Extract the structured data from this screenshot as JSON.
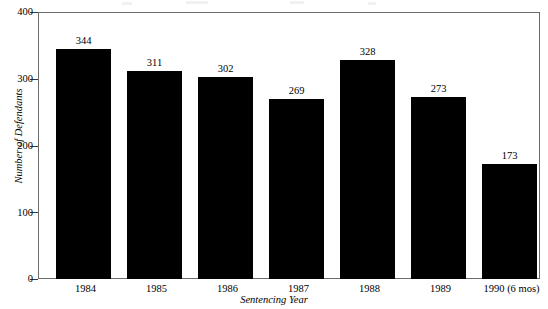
{
  "chart_data": {
    "type": "bar",
    "title": "",
    "xlabel": "Sentencing Year",
    "ylabel": "Number of Defendants",
    "categories": [
      "1984",
      "1985",
      "1986",
      "1987",
      "1988",
      "1989",
      "1990 (6 mos)"
    ],
    "values": [
      344,
      311,
      302,
      269,
      328,
      273,
      173
    ],
    "ylim": [
      0,
      400
    ],
    "yticks": [
      0,
      100,
      200,
      300,
      400
    ],
    "ytick_labels": [
      "0",
      "100",
      "200",
      "300",
      "400"
    ],
    "grid": false,
    "legend": null,
    "bar_color": "#000000",
    "frame_color": "#6b6b6b",
    "background": "#ffffff",
    "data_labels_shown": true
  }
}
